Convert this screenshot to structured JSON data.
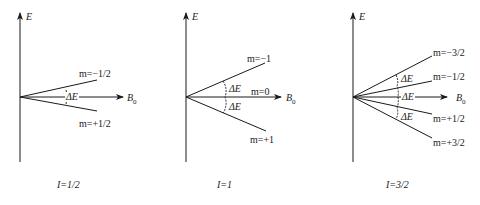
{
  "figure": {
    "axis_label_energy": "E",
    "field_label": "B",
    "field_subscript": "0",
    "delta_e": "ΔE",
    "colors": {
      "line": "#1a1a1a",
      "background": "#ffffff"
    }
  },
  "panels": [
    {
      "caption": "I=1/2",
      "levels": [
        "m=−1/2",
        "m=+1/2"
      ],
      "splittings": [
        "ΔE"
      ]
    },
    {
      "caption": "I=1",
      "levels": [
        "m=−1",
        "m=0",
        "m=+1"
      ],
      "splittings": [
        "ΔE",
        "ΔE"
      ]
    },
    {
      "caption": "I=3/2",
      "levels": [
        "m=−3/2",
        "m=−1/2",
        "m=+1/2",
        "m=+3/2"
      ],
      "splittings": [
        "ΔE",
        "ΔE",
        "ΔE"
      ]
    }
  ]
}
